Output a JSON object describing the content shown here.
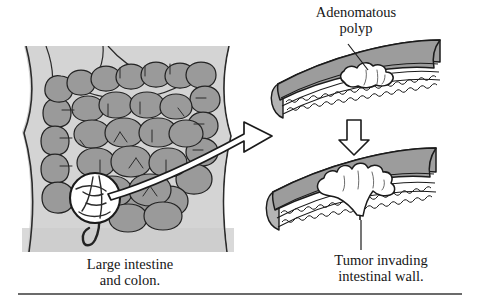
{
  "figure": {
    "kind": "medical-illustration",
    "background_color": "#ffffff",
    "ink_color": "#1a1a1a",
    "tissue_gray": "#9a9a9a",
    "body_gray": "#d2d2d2",
    "highlight_white": "#ffffff"
  },
  "labels": {
    "polyp_line1": "Adenomatous",
    "polyp_line2": "polyp"
  },
  "captions": {
    "left_line1": "Large intestine",
    "left_line2": "and colon.",
    "right_line1": "Tumor invading",
    "right_line2": "intestinal wall."
  },
  "panels": {
    "torso": {
      "name": "Abdomen with large intestine and colon",
      "callout_circle": "magnified bowel segment"
    },
    "slab_top": {
      "name": "Intestinal wall cross-section with adenomatous polyp",
      "feature": "white lobed polyp on mucosal surface"
    },
    "slab_bottom": {
      "name": "Intestinal wall cross-section with invasive tumor",
      "feature": "lobed tumor penetrating through wall layers"
    }
  },
  "connectors": {
    "magnify_arrow": "curved ribbon arrow from torso callout to top slab",
    "progression_arrow": "downward block arrow from top slab to bottom slab",
    "polyp_leader": "leader line from polyp label to polyp",
    "tumor_leader": "leader line from tumor to caption"
  },
  "rule": {
    "name": "bottom horizontal rule"
  }
}
